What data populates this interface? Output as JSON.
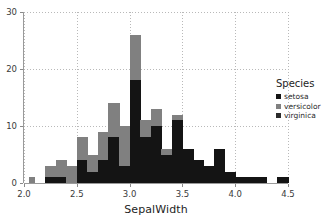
{
  "chart_data": {
    "type": "bar",
    "subtype": "stacked-histogram",
    "title": "",
    "xlabel": "SepalWidth",
    "ylabel": "",
    "xlim": [
      2.0,
      4.5
    ],
    "ylim": [
      0,
      30
    ],
    "bin_width": 0.05,
    "grid": true,
    "legend_position": "right",
    "legend_title": "Species",
    "xticks": [
      "2.0",
      "2.5",
      "3.0",
      "3.5",
      "4.0",
      "4.5"
    ],
    "xtick_values": [
      2.0,
      2.5,
      3.0,
      3.5,
      4.0,
      4.5
    ],
    "yticks": [
      "0",
      "10",
      "20",
      "30"
    ],
    "ytick_values": [
      0,
      10,
      20,
      30
    ],
    "colors": {
      "setosa": "#141414",
      "versicolor": "#808080",
      "virginica": "#2b2b2b",
      "grid": "#b9b9b9",
      "axis": "#9a9a9a",
      "background": "#ffffff"
    },
    "series": [
      {
        "name": "setosa",
        "color": "#141414"
      },
      {
        "name": "versicolor",
        "color": "#808080"
      },
      {
        "name": "virginica",
        "color": "#2b2b2b"
      }
    ],
    "bins": [
      {
        "x0": 2.0,
        "x1": 2.05,
        "setosa": 0,
        "versicolor": 0,
        "virginica": 0,
        "total": 0
      },
      {
        "x0": 2.05,
        "x1": 2.1,
        "setosa": 0,
        "versicolor": 1,
        "virginica": 0,
        "total": 1
      },
      {
        "x0": 2.1,
        "x1": 2.15,
        "setosa": 0,
        "versicolor": 0,
        "virginica": 0,
        "total": 0
      },
      {
        "x0": 2.15,
        "x1": 2.2,
        "setosa": 0,
        "versicolor": 0,
        "virginica": 0,
        "total": 0
      },
      {
        "x0": 2.2,
        "x1": 2.25,
        "setosa": 1,
        "versicolor": 2,
        "virginica": 0,
        "total": 3
      },
      {
        "x0": 2.25,
        "x1": 2.3,
        "setosa": 1,
        "versicolor": 2,
        "virginica": 0,
        "total": 3
      },
      {
        "x0": 2.3,
        "x1": 2.35,
        "setosa": 1,
        "versicolor": 3,
        "virginica": 0,
        "total": 4
      },
      {
        "x0": 2.35,
        "x1": 2.4,
        "setosa": 1,
        "versicolor": 3,
        "virginica": 0,
        "total": 4
      },
      {
        "x0": 2.4,
        "x1": 2.45,
        "setosa": 0,
        "versicolor": 3,
        "virginica": 0,
        "total": 3
      },
      {
        "x0": 2.45,
        "x1": 2.5,
        "setosa": 0,
        "versicolor": 3,
        "virginica": 0,
        "total": 3
      },
      {
        "x0": 2.5,
        "x1": 2.55,
        "setosa": 4,
        "versicolor": 4,
        "virginica": 0,
        "total": 8
      },
      {
        "x0": 2.55,
        "x1": 2.6,
        "setosa": 4,
        "versicolor": 4,
        "virginica": 0,
        "total": 8
      },
      {
        "x0": 2.6,
        "x1": 2.65,
        "setosa": 2,
        "versicolor": 3,
        "virginica": 0,
        "total": 5
      },
      {
        "x0": 2.65,
        "x1": 2.7,
        "setosa": 2,
        "versicolor": 3,
        "virginica": 0,
        "total": 5
      },
      {
        "x0": 2.7,
        "x1": 2.75,
        "setosa": 4,
        "versicolor": 5,
        "virginica": 0,
        "total": 9
      },
      {
        "x0": 2.75,
        "x1": 2.8,
        "setosa": 4,
        "versicolor": 5,
        "virginica": 0,
        "total": 9
      },
      {
        "x0": 2.8,
        "x1": 2.85,
        "setosa": 8,
        "versicolor": 6,
        "virginica": 0,
        "total": 14
      },
      {
        "x0": 2.85,
        "x1": 2.9,
        "setosa": 8,
        "versicolor": 6,
        "virginica": 0,
        "total": 14
      },
      {
        "x0": 2.9,
        "x1": 2.95,
        "setosa": 3,
        "versicolor": 7,
        "virginica": 0,
        "total": 10
      },
      {
        "x0": 2.95,
        "x1": 3.0,
        "setosa": 3,
        "versicolor": 7,
        "virginica": 0,
        "total": 10
      },
      {
        "x0": 3.0,
        "x1": 3.05,
        "setosa": 18,
        "versicolor": 8,
        "virginica": 0,
        "total": 26
      },
      {
        "x0": 3.05,
        "x1": 3.1,
        "setosa": 18,
        "versicolor": 8,
        "virginica": 0,
        "total": 26
      },
      {
        "x0": 3.1,
        "x1": 3.15,
        "setosa": 8,
        "versicolor": 3,
        "virginica": 0,
        "total": 11
      },
      {
        "x0": 3.15,
        "x1": 3.2,
        "setosa": 8,
        "versicolor": 3,
        "virginica": 0,
        "total": 11
      },
      {
        "x0": 3.2,
        "x1": 3.25,
        "setosa": 10,
        "versicolor": 3,
        "virginica": 0,
        "total": 13
      },
      {
        "x0": 3.25,
        "x1": 3.3,
        "setosa": 10,
        "versicolor": 3,
        "virginica": 0,
        "total": 13
      },
      {
        "x0": 3.3,
        "x1": 3.35,
        "setosa": 5,
        "versicolor": 1,
        "virginica": 0,
        "total": 6
      },
      {
        "x0": 3.35,
        "x1": 3.4,
        "setosa": 5,
        "versicolor": 1,
        "virginica": 0,
        "total": 6
      },
      {
        "x0": 3.4,
        "x1": 3.45,
        "setosa": 11,
        "versicolor": 1,
        "virginica": 0,
        "total": 12
      },
      {
        "x0": 3.45,
        "x1": 3.5,
        "setosa": 11,
        "versicolor": 1,
        "virginica": 0,
        "total": 12
      },
      {
        "x0": 3.5,
        "x1": 3.55,
        "setosa": 6,
        "versicolor": 0,
        "virginica": 0,
        "total": 6
      },
      {
        "x0": 3.55,
        "x1": 3.6,
        "setosa": 6,
        "versicolor": 0,
        "virginica": 0,
        "total": 6
      },
      {
        "x0": 3.6,
        "x1": 3.65,
        "setosa": 4,
        "versicolor": 0,
        "virginica": 0,
        "total": 4
      },
      {
        "x0": 3.65,
        "x1": 3.7,
        "setosa": 4,
        "versicolor": 0,
        "virginica": 0,
        "total": 4
      },
      {
        "x0": 3.7,
        "x1": 3.75,
        "setosa": 3,
        "versicolor": 0,
        "virginica": 0,
        "total": 3
      },
      {
        "x0": 3.75,
        "x1": 3.8,
        "setosa": 3,
        "versicolor": 0,
        "virginica": 0,
        "total": 3
      },
      {
        "x0": 3.8,
        "x1": 3.85,
        "setosa": 6,
        "versicolor": 0,
        "virginica": 0,
        "total": 6
      },
      {
        "x0": 3.85,
        "x1": 3.9,
        "setosa": 6,
        "versicolor": 0,
        "virginica": 0,
        "total": 6
      },
      {
        "x0": 3.9,
        "x1": 3.95,
        "setosa": 2,
        "versicolor": 0,
        "virginica": 0,
        "total": 2
      },
      {
        "x0": 3.95,
        "x1": 4.0,
        "setosa": 2,
        "versicolor": 0,
        "virginica": 0,
        "total": 2
      },
      {
        "x0": 4.0,
        "x1": 4.05,
        "setosa": 1,
        "versicolor": 0,
        "virginica": 0,
        "total": 1
      },
      {
        "x0": 4.05,
        "x1": 4.1,
        "setosa": 1,
        "versicolor": 0,
        "virginica": 0,
        "total": 1
      },
      {
        "x0": 4.1,
        "x1": 4.15,
        "setosa": 1,
        "versicolor": 0,
        "virginica": 0,
        "total": 1
      },
      {
        "x0": 4.15,
        "x1": 4.2,
        "setosa": 1,
        "versicolor": 0,
        "virginica": 0,
        "total": 1
      },
      {
        "x0": 4.2,
        "x1": 4.25,
        "setosa": 1,
        "versicolor": 0,
        "virginica": 0,
        "total": 1
      },
      {
        "x0": 4.25,
        "x1": 4.3,
        "setosa": 1,
        "versicolor": 0,
        "virginica": 0,
        "total": 1
      },
      {
        "x0": 4.3,
        "x1": 4.35,
        "setosa": 0,
        "versicolor": 0,
        "virginica": 0,
        "total": 0
      },
      {
        "x0": 4.35,
        "x1": 4.4,
        "setosa": 0,
        "versicolor": 0,
        "virginica": 0,
        "total": 0
      },
      {
        "x0": 4.4,
        "x1": 4.45,
        "setosa": 1,
        "versicolor": 0,
        "virginica": 0,
        "total": 1
      },
      {
        "x0": 4.45,
        "x1": 4.5,
        "setosa": 1,
        "versicolor": 0,
        "virginica": 0,
        "total": 1
      }
    ]
  },
  "legend": {
    "title": "Species",
    "items": [
      {
        "label": "setosa",
        "color": "#141414"
      },
      {
        "label": "versicolor",
        "color": "#808080"
      },
      {
        "label": "virginica",
        "color": "#2b2b2b"
      }
    ]
  },
  "axes": {
    "x_label": "SepalWidth",
    "y_label": ""
  }
}
